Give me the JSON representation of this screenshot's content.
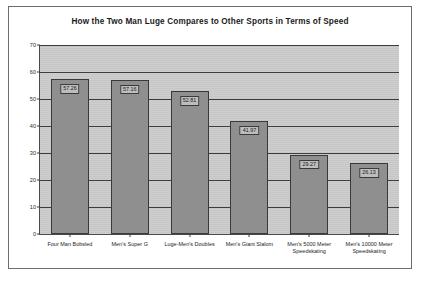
{
  "chart_data": {
    "type": "bar",
    "title": "How the Two Man Luge Compares to Other Sports in Terms of Speed",
    "xlabel": "",
    "ylabel": "",
    "ylim": [
      0,
      70
    ],
    "yticks": [
      0,
      10,
      20,
      30,
      40,
      50,
      60,
      70
    ],
    "grid": true,
    "legend": "none",
    "categories": [
      "Four Man Bobsled",
      "Men's Super G",
      "Luge-Men's Doubles",
      "Men's Giant Slalom",
      "Men's 5000 Meter\nSpeedskating",
      "Men's 10000 Meter\nSpeedskating"
    ],
    "values": [
      57.26,
      57.16,
      52.81,
      41.97,
      29.27,
      26.13
    ],
    "value_labels": [
      "57.26",
      "57.16",
      "52.81",
      "41.97",
      "29.27",
      "26.13"
    ],
    "colors": {
      "bar_fill": "#8f8f8f",
      "bar_border": "#3a3a3a",
      "plot_background": "#c9c9c9",
      "gridline": "#3d3d3d",
      "frame_border": "#6d6d6d",
      "text": "#1c1c1c"
    }
  }
}
